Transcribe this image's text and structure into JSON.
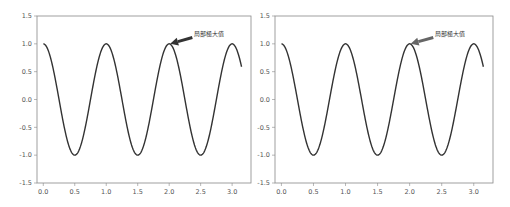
{
  "chart_data": [
    {
      "type": "line",
      "title": "",
      "xlabel": "",
      "ylabel": "",
      "function": "cos(2*pi*x)",
      "x_range": [
        0,
        3.15
      ],
      "xlim": [
        -0.1,
        3.3
      ],
      "ylim": [
        -1.5,
        1.5
      ],
      "xticks": [
        "0.0",
        "0.5",
        "1.0",
        "1.5",
        "2.0",
        "2.5",
        "3.0"
      ],
      "yticks": [
        "1.5",
        "1.0",
        "0.5",
        "0.0",
        "-0.5",
        "-1.0",
        "-1.5"
      ],
      "grid": false,
      "series": [
        {
          "name": "cos",
          "color": "#333333"
        }
      ],
      "annotation": {
        "text": "局部極大值",
        "xy": [
          2.0,
          1.0
        ],
        "xytext": [
          2.4,
          1.15
        ],
        "arrow_color": "#333333"
      }
    },
    {
      "type": "line",
      "title": "",
      "xlabel": "",
      "ylabel": "",
      "function": "cos(2*pi*x)",
      "x_range": [
        0,
        3.15
      ],
      "xlim": [
        -0.1,
        3.3
      ],
      "ylim": [
        -1.5,
        1.5
      ],
      "xticks": [
        "0.0",
        "0.5",
        "1.0",
        "1.5",
        "2.0",
        "2.5",
        "3.0"
      ],
      "yticks": [
        "1.5",
        "1.0",
        "0.5",
        "0.0",
        "-0.5",
        "-1.0",
        "-1.5"
      ],
      "grid": false,
      "series": [
        {
          "name": "cos",
          "color": "#333333"
        }
      ],
      "annotation": {
        "text": "局部極大值",
        "xy": [
          2.0,
          1.0
        ],
        "xytext": [
          2.4,
          1.15
        ],
        "arrow_color": "#666666"
      }
    }
  ]
}
